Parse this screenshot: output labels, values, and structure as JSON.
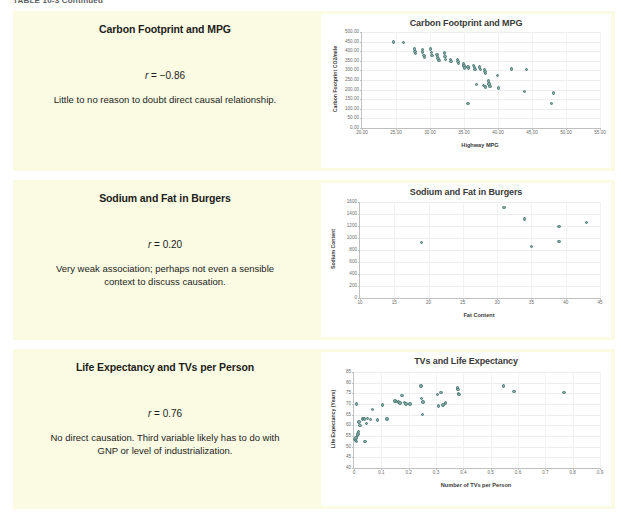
{
  "table_caption": "TABLE 10-3  Continued",
  "theme": {
    "panel_bg": "#fbfbe3",
    "page_bg": "#ffffff",
    "marker_color": "#7ea8a3",
    "marker_edge": "#4e7a75",
    "text_color": "#1d1d1b",
    "axis_color": "#bfbfbf"
  },
  "rows": [
    {
      "pair_title": "Carbon Footprint and MPG",
      "r_label": "r",
      "r_equals": " = ",
      "r_value": "−0.86",
      "explanation": "Little to no reason to doubt direct causal relationship."
    },
    {
      "pair_title": "Sodium and Fat in Burgers",
      "r_label": "r",
      "r_equals": " = ",
      "r_value": "0.20",
      "explanation": "Very weak association; perhaps not even a sensible context to discuss causation."
    },
    {
      "pair_title": "Life Expectancy and TVs per Person",
      "r_label": "r",
      "r_equals": " = ",
      "r_value": "0.76",
      "explanation": "No direct causation. Third variable likely has to do with GNP or level of industrialization."
    }
  ],
  "chart_data": [
    {
      "type": "scatter",
      "title": "Carbon Footprint and MPG",
      "xlabel": "Highway MPG",
      "ylabel": "Carbon Footprint CO2/mile",
      "xlim": [
        20,
        55
      ],
      "ylim": [
        0,
        500
      ],
      "xticks": [
        "20.00",
        "25.00",
        "30.00",
        "35.00",
        "40.00",
        "45.00",
        "50.00",
        "55.00"
      ],
      "xtick_values": [
        20,
        25,
        30,
        35,
        40,
        45,
        50,
        55
      ],
      "yticks": [
        "0.00",
        "50.00",
        "100.00",
        "150.00",
        "200.00",
        "250.00",
        "300.00",
        "350.00",
        "400.00",
        "450.00",
        "500.00"
      ],
      "ytick_values": [
        0,
        50,
        100,
        150,
        200,
        250,
        300,
        350,
        400,
        450,
        500
      ],
      "grid": true,
      "legend": "none",
      "points": [
        [
          24.6,
          447
        ],
        [
          26.1,
          444
        ],
        [
          27.7,
          412
        ],
        [
          27.8,
          397
        ],
        [
          27.9,
          388
        ],
        [
          28.9,
          408
        ],
        [
          28.9,
          396
        ],
        [
          29.1,
          378
        ],
        [
          29.2,
          368
        ],
        [
          30.1,
          412
        ],
        [
          30.2,
          392
        ],
        [
          30.3,
          378
        ],
        [
          31.0,
          383
        ],
        [
          31.1,
          371
        ],
        [
          31.2,
          361
        ],
        [
          31.3,
          352
        ],
        [
          32.1,
          390
        ],
        [
          32.2,
          372
        ],
        [
          32.3,
          357
        ],
        [
          33.0,
          357
        ],
        [
          33.1,
          347
        ],
        [
          34.0,
          357
        ],
        [
          34.1,
          345
        ],
        [
          34.2,
          337
        ],
        [
          34.9,
          333
        ],
        [
          35.0,
          322
        ],
        [
          35.1,
          313
        ],
        [
          35.6,
          318
        ],
        [
          35.7,
          309
        ],
        [
          36.4,
          324
        ],
        [
          36.5,
          314
        ],
        [
          36.6,
          305
        ],
        [
          37.3,
          318
        ],
        [
          37.4,
          306
        ],
        [
          38.0,
          305
        ],
        [
          38.1,
          294
        ],
        [
          38.2,
          285
        ],
        [
          36.8,
          226
        ],
        [
          37.9,
          222
        ],
        [
          38.2,
          213
        ],
        [
          38.6,
          245
        ],
        [
          38.7,
          230
        ],
        [
          38.8,
          216
        ],
        [
          39.9,
          273
        ],
        [
          40.1,
          208
        ],
        [
          42.0,
          307
        ],
        [
          44.2,
          305
        ],
        [
          43.9,
          189
        ],
        [
          48.2,
          183
        ],
        [
          35.6,
          128
        ],
        [
          47.9,
          129
        ]
      ]
    },
    {
      "type": "scatter",
      "title": "Sodium and Fat in Burgers",
      "xlabel": "Fat Content",
      "ylabel": "Sodium Content",
      "xlim": [
        10,
        45
      ],
      "ylim": [
        0,
        1600
      ],
      "xticks": [
        "10",
        "15",
        "20",
        "25",
        "30",
        "35",
        "40",
        "45"
      ],
      "xtick_values": [
        10,
        15,
        20,
        25,
        30,
        35,
        40,
        45
      ],
      "yticks": [
        "0",
        "200",
        "400",
        "600",
        "800",
        "1000",
        "1200",
        "1400",
        "1600"
      ],
      "ytick_values": [
        0,
        200,
        400,
        600,
        800,
        1000,
        1200,
        1400,
        1600
      ],
      "grid": true,
      "legend": "none",
      "points": [
        [
          19,
          930
        ],
        [
          31,
          1510
        ],
        [
          34,
          1320
        ],
        [
          35,
          860
        ],
        [
          39,
          1190
        ],
        [
          39,
          940
        ],
        [
          43,
          1260
        ]
      ]
    },
    {
      "type": "scatter",
      "title": "TVs and Life Expectancy",
      "xlabel": "Number of TVs per Person",
      "ylabel": "Life Expectancy (Years)",
      "xlim": [
        0,
        0.9
      ],
      "ylim": [
        40,
        85
      ],
      "xticks": [
        "0",
        "0.1",
        "0.2",
        "0.3",
        "0.4",
        "0.5",
        "0.6",
        "0.7",
        "0.8",
        "0.9"
      ],
      "xtick_values": [
        0,
        0.1,
        0.2,
        0.3,
        0.4,
        0.5,
        0.6,
        0.7,
        0.8,
        0.9
      ],
      "yticks": [
        "40",
        "45",
        "50",
        "55",
        "60",
        "65",
        "70",
        "75",
        "80",
        "85"
      ],
      "ytick_values": [
        40,
        45,
        50,
        55,
        60,
        65,
        70,
        75,
        80,
        85
      ],
      "grid": true,
      "legend": "none",
      "points": [
        [
          0.004,
          53.5
        ],
        [
          0.006,
          52.8
        ],
        [
          0.008,
          54.0
        ],
        [
          0.01,
          52.4
        ],
        [
          0.012,
          55.5
        ],
        [
          0.014,
          56.0
        ],
        [
          0.016,
          57.0
        ],
        [
          0.018,
          61.5
        ],
        [
          0.022,
          60.0
        ],
        [
          0.03,
          63.0
        ],
        [
          0.034,
          63.2
        ],
        [
          0.038,
          63.0
        ],
        [
          0.04,
          52.5
        ],
        [
          0.046,
          61.0
        ],
        [
          0.05,
          63.2
        ],
        [
          0.06,
          62.8
        ],
        [
          0.01,
          70.0
        ],
        [
          0.068,
          67.5
        ],
        [
          0.085,
          62.5
        ],
        [
          0.105,
          69.5
        ],
        [
          0.12,
          63.0
        ],
        [
          0.15,
          71.5
        ],
        [
          0.155,
          71.2
        ],
        [
          0.162,
          71.0
        ],
        [
          0.168,
          70.5
        ],
        [
          0.175,
          74.0
        ],
        [
          0.185,
          70.8
        ],
        [
          0.19,
          70.0
        ],
        [
          0.205,
          70.0
        ],
        [
          0.245,
          78.5
        ],
        [
          0.248,
          72.5
        ],
        [
          0.252,
          71.0
        ],
        [
          0.25,
          65.0
        ],
        [
          0.305,
          74.5
        ],
        [
          0.318,
          75.5
        ],
        [
          0.31,
          69.0
        ],
        [
          0.325,
          69.5
        ],
        [
          0.335,
          70.5
        ],
        [
          0.378,
          77.5
        ],
        [
          0.38,
          76.8
        ],
        [
          0.382,
          75.0
        ],
        [
          0.384,
          74.5
        ],
        [
          0.548,
          78.5
        ],
        [
          0.585,
          76.0
        ],
        [
          0.768,
          75.5
        ]
      ]
    }
  ]
}
